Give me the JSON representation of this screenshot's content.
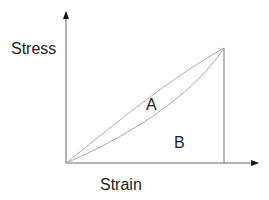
{
  "diagram": {
    "y_axis_label": "Stress",
    "x_axis_label": "Strain",
    "region_a_label": "A",
    "region_b_label": "B",
    "colors": {
      "axis": "#555555",
      "curve": "#aaaaaa",
      "text": "#222222"
    }
  }
}
